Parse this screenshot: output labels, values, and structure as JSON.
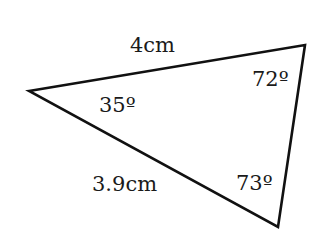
{
  "diagram": {
    "type": "triangle",
    "stroke_color": "#111111",
    "vertices": {
      "left": {
        "x": 29,
        "y": 91
      },
      "top_right": {
        "x": 305,
        "y": 45
      },
      "bottom_right": {
        "x": 278,
        "y": 227
      }
    },
    "sides": {
      "top": {
        "label": "4cm"
      },
      "bottom_left": {
        "label": "3.9cm"
      }
    },
    "angles": {
      "left": {
        "label": "35º"
      },
      "top_right": {
        "label": "72º"
      },
      "bottom_right": {
        "label": "73º"
      }
    }
  }
}
